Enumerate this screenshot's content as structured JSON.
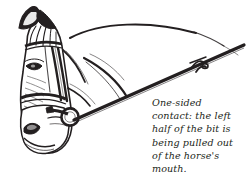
{
  "figure": {
    "background_color": "#ffffff",
    "ink_color": "#231f20"
  },
  "caption": {
    "full_text": "One-sided contact: the left half of the bit is being pulled out of the horse's mouth.",
    "lines": [
      "One-sided",
      "contact: the left",
      "half of the bit is",
      "being pulled out",
      "of the horse's",
      "mouth."
    ],
    "style": "italic",
    "color": "#231f20"
  },
  "illustration_parts": {
    "ear": "horse-ear",
    "forelock": "forelock-tuft",
    "eye": "horse-eye",
    "browband": "bridle-browband",
    "cheekpiece": "bridle-cheekpiece",
    "noseband": "bridle-noseband",
    "throatlatch": "bridle-throatlatch",
    "nostril": "horse-nostril",
    "muzzle": "horse-muzzle",
    "bit_ring": "bit-ring",
    "rein": "taut-rein",
    "rein_buckle": "rein-buckle",
    "neck_crest": "neck-crest-line",
    "neck_underline": "neck-underline"
  }
}
